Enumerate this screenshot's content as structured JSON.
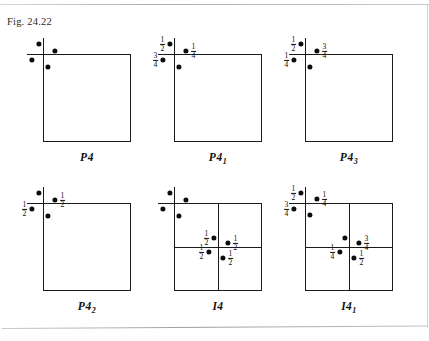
{
  "figure": {
    "caption": "Fig. 24.22"
  },
  "panels": [
    {
      "id": "p4",
      "label_main": "P4",
      "label_sub": "",
      "cell": {
        "x": 43,
        "y": 54,
        "w": 88,
        "h": 88
      },
      "axis_h": {
        "x": 27,
        "y": 54,
        "len": 104
      },
      "axis_v": {
        "x": 43,
        "y": 38,
        "len": 104
      },
      "dividers": [],
      "dots": [
        {
          "x": 39,
          "y": 44,
          "frac": ""
        },
        {
          "x": 55,
          "y": 51,
          "frac": ""
        },
        {
          "x": 32,
          "y": 60,
          "frac": ""
        },
        {
          "x": 48,
          "y": 67,
          "frac": ""
        }
      ],
      "label_pos": {
        "x": 87,
        "y": 151
      }
    },
    {
      "id": "p41",
      "label_main": "P4",
      "label_sub": "1",
      "cell": {
        "x": 174,
        "y": 54,
        "w": 88,
        "h": 88
      },
      "axis_h": {
        "x": 158,
        "y": 54,
        "len": 104
      },
      "axis_v": {
        "x": 174,
        "y": 38,
        "len": 104
      },
      "dividers": [],
      "dots": [
        {
          "x": 170,
          "y": 44,
          "frac": "1/2",
          "frac_side": "left"
        },
        {
          "x": 186,
          "y": 51,
          "frac": "1/4",
          "frac_side": "right"
        },
        {
          "x": 163,
          "y": 60,
          "frac": "3/4",
          "frac_side": "left"
        },
        {
          "x": 179,
          "y": 67,
          "frac": ""
        }
      ],
      "label_pos": {
        "x": 218,
        "y": 151
      }
    },
    {
      "id": "p43",
      "label_main": "P4",
      "label_sub": "3",
      "cell": {
        "x": 305,
        "y": 54,
        "w": 88,
        "h": 88
      },
      "axis_h": {
        "x": 289,
        "y": 54,
        "len": 104
      },
      "axis_v": {
        "x": 305,
        "y": 38,
        "len": 104
      },
      "dividers": [],
      "dots": [
        {
          "x": 301,
          "y": 44,
          "frac": "1/2",
          "frac_side": "left"
        },
        {
          "x": 317,
          "y": 51,
          "frac": "3/4",
          "frac_side": "right"
        },
        {
          "x": 294,
          "y": 60,
          "frac": "1/4",
          "frac_side": "left"
        },
        {
          "x": 310,
          "y": 67,
          "frac": ""
        }
      ],
      "label_pos": {
        "x": 349,
        "y": 151
      }
    },
    {
      "id": "p42",
      "label_main": "P4",
      "label_sub": "2",
      "cell": {
        "x": 43,
        "y": 203,
        "w": 88,
        "h": 88
      },
      "axis_h": {
        "x": 27,
        "y": 203,
        "len": 104
      },
      "axis_v": {
        "x": 43,
        "y": 187,
        "len": 104
      },
      "dividers": [],
      "dots": [
        {
          "x": 39,
          "y": 193,
          "frac": ""
        },
        {
          "x": 55,
          "y": 200,
          "frac": "1/2",
          "frac_side": "right"
        },
        {
          "x": 32,
          "y": 209,
          "frac": "1/2",
          "frac_side": "left"
        },
        {
          "x": 48,
          "y": 216,
          "frac": ""
        }
      ],
      "label_pos": {
        "x": 87,
        "y": 300
      }
    },
    {
      "id": "i4",
      "label_main": "I4",
      "label_sub": "",
      "cell": {
        "x": 174,
        "y": 203,
        "w": 88,
        "h": 88
      },
      "axis_h": {
        "x": 158,
        "y": 203,
        "len": 104
      },
      "axis_v": {
        "x": 174,
        "y": 187,
        "len": 104
      },
      "dividers": [
        {
          "dir": "h",
          "x": 174,
          "y": 247,
          "len": 88
        },
        {
          "dir": "v",
          "x": 218,
          "y": 203,
          "len": 88
        }
      ],
      "dots": [
        {
          "x": 170,
          "y": 193,
          "frac": ""
        },
        {
          "x": 186,
          "y": 200,
          "frac": ""
        },
        {
          "x": 163,
          "y": 209,
          "frac": ""
        },
        {
          "x": 179,
          "y": 216,
          "frac": ""
        },
        {
          "x": 214,
          "y": 238,
          "frac": "1/2",
          "frac_side": "left"
        },
        {
          "x": 228,
          "y": 243,
          "frac": "1/2",
          "frac_side": "right"
        },
        {
          "x": 209,
          "y": 252,
          "frac": "1/2",
          "frac_side": "left"
        },
        {
          "x": 223,
          "y": 258,
          "frac": "1/2",
          "frac_side": "right"
        }
      ],
      "label_pos": {
        "x": 218,
        "y": 300
      }
    },
    {
      "id": "i41",
      "label_main": "I4",
      "label_sub": "1",
      "cell": {
        "x": 305,
        "y": 203,
        "w": 88,
        "h": 88
      },
      "axis_h": {
        "x": 289,
        "y": 203,
        "len": 104
      },
      "axis_v": {
        "x": 305,
        "y": 187,
        "len": 104
      },
      "dividers": [
        {
          "dir": "h",
          "x": 305,
          "y": 247,
          "len": 88
        },
        {
          "dir": "v",
          "x": 349,
          "y": 203,
          "len": 88
        }
      ],
      "dots": [
        {
          "x": 301,
          "y": 193,
          "frac": "1/2",
          "frac_side": "left"
        },
        {
          "x": 317,
          "y": 199,
          "frac": "1/4",
          "frac_side": "right"
        },
        {
          "x": 294,
          "y": 209,
          "frac": "3/4",
          "frac_side": "left"
        },
        {
          "x": 310,
          "y": 215,
          "frac": ""
        },
        {
          "x": 345,
          "y": 238,
          "frac": ""
        },
        {
          "x": 359,
          "y": 243,
          "frac": "3/4",
          "frac_side": "right"
        },
        {
          "x": 340,
          "y": 252,
          "frac": "1/4",
          "frac_side": "left"
        },
        {
          "x": 354,
          "y": 258,
          "frac": "1/2",
          "frac_side": "right"
        }
      ],
      "label_pos": {
        "x": 349,
        "y": 300
      }
    }
  ],
  "chart_data": {
    "type": "diagram",
    "title": "Fig. 24.22",
    "panel_labels": [
      "P4",
      "P41",
      "P43",
      "P42",
      "I4",
      "I41"
    ],
    "fraction_labels_used": [
      "1/4",
      "1/2",
      "3/4"
    ]
  }
}
